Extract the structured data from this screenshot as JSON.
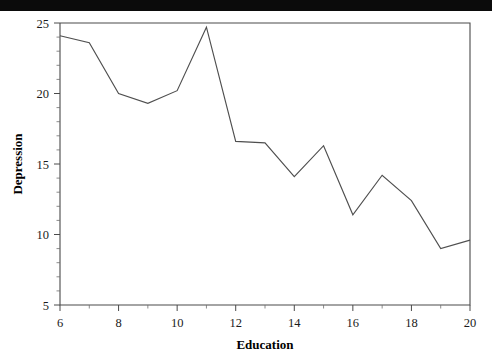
{
  "window": {
    "top_bar_color": "#0b0b0b",
    "background_color": "#ffffff"
  },
  "chart_data": {
    "type": "line",
    "title": "",
    "subtitle": "",
    "xlabel": "Education",
    "ylabel": "Depression",
    "x": [
      6,
      7,
      8,
      9,
      10,
      11,
      12,
      13,
      14,
      15,
      16,
      17,
      18,
      19,
      20
    ],
    "values": [
      24.1,
      23.6,
      20.0,
      19.3,
      20.2,
      24.7,
      16.6,
      16.5,
      14.1,
      16.3,
      11.4,
      14.2,
      12.4,
      9.0,
      9.6
    ],
    "series": [
      {
        "name": "Depression",
        "values": [
          24.1,
          23.6,
          20.0,
          19.3,
          20.2,
          24.7,
          16.6,
          16.5,
          14.1,
          16.3,
          11.4,
          14.2,
          12.4,
          9.0,
          9.6
        ]
      }
    ],
    "xlim": [
      6,
      20
    ],
    "ylim": [
      5,
      25
    ],
    "x_major_ticks": [
      6,
      8,
      10,
      12,
      14,
      16,
      18,
      20
    ],
    "x_major_tick_labels": [
      "6",
      "8",
      "10",
      "12",
      "14",
      "16",
      "18",
      "20"
    ],
    "x_minor_ticks": [
      7,
      9,
      11,
      13,
      15,
      17,
      19
    ],
    "y_major_ticks": [
      5,
      10,
      15,
      20,
      25
    ],
    "y_major_tick_labels": [
      "5",
      "10",
      "15",
      "20",
      "25"
    ],
    "y_minor_ticks": [
      6,
      7,
      8,
      9,
      11,
      12,
      13,
      14,
      16,
      17,
      18,
      19,
      21,
      22,
      23,
      24
    ],
    "grid": false,
    "legend": false,
    "legend_position": "none",
    "line_color": "#4f4f4f",
    "axis_color": "#4a4a4a",
    "annotations": []
  }
}
